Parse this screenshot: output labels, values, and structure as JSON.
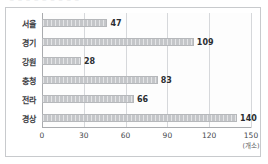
{
  "top_clip_text": "‾ ‾ ‾ ‾ ‾ ‾ ‾ ‾ ‾",
  "chart_data": {
    "type": "bar",
    "orientation": "horizontal",
    "title": "",
    "subtitle": "",
    "xlabel": "",
    "ylabel": "",
    "unit_label": "(개소)",
    "categories": [
      "서울",
      "경기",
      "강원",
      "충청",
      "전라",
      "경상"
    ],
    "values": [
      47,
      109,
      28,
      83,
      66,
      140
    ],
    "xlim": [
      0,
      150
    ],
    "xticks": [
      0,
      30,
      60,
      90,
      120,
      150
    ],
    "xtick_labels": [
      "0",
      "30",
      "60",
      "90",
      "120",
      "150"
    ],
    "grid": true,
    "legend": null,
    "bar_color": "#c4c6c9",
    "bar_border_color": "#b6b8bb",
    "gridline_color": "#d6d8db",
    "axis_color": "#a9abae",
    "label_color": "#3d4044",
    "value_color": "#2b2e31",
    "frame_border_color": "#c8cacd",
    "background_color": "#ffffff"
  }
}
